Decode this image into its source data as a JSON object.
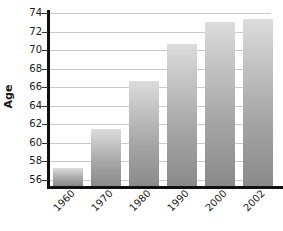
{
  "chart_data": {
    "type": "bar",
    "title": "",
    "xlabel": "",
    "ylabel": "Age",
    "categories": [
      "1960",
      "1970",
      "1980",
      "1990",
      "2000",
      "2002"
    ],
    "values": [
      57.2,
      61.5,
      66.6,
      70.6,
      73.0,
      73.3
    ],
    "ylim": [
      55.3,
      74
    ],
    "y_ticks": [
      56,
      58,
      60,
      62,
      64,
      66,
      68,
      70,
      72,
      74
    ],
    "y_tick_labels": [
      "56",
      "58",
      "60",
      "62",
      "64",
      "66",
      "68",
      "70",
      "72",
      "74"
    ],
    "grid": true,
    "legend": "none",
    "bar_color_top": "#dcdcdc",
    "bar_color_bottom": "#8a8a8a",
    "gridline_color": "#c9c9c9",
    "axis_color": "#111111",
    "background_color": "#ffffff"
  },
  "axis": {
    "y_title": "Age"
  }
}
